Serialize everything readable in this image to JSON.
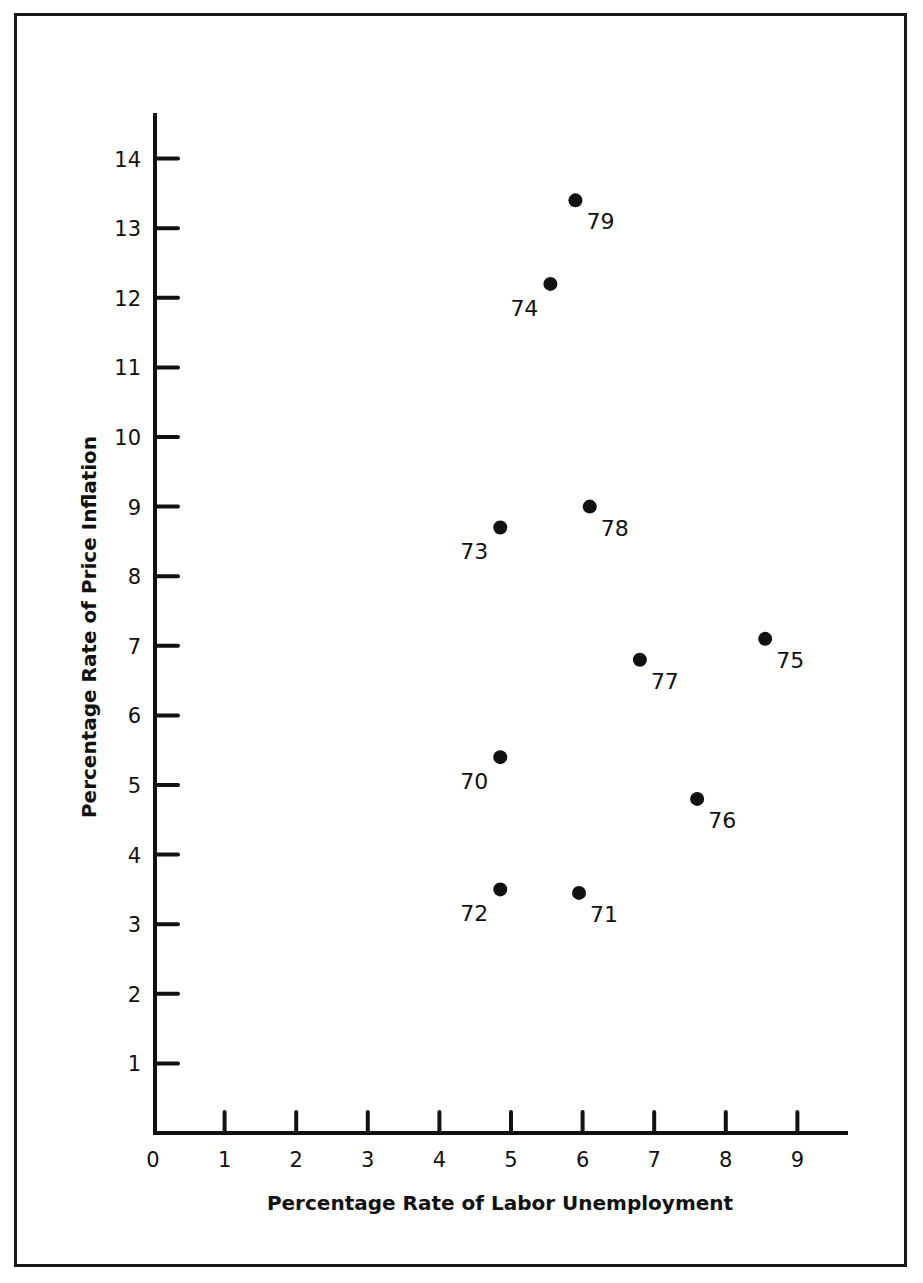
{
  "chart_data": {
    "type": "scatter",
    "title": "",
    "xlabel": "Percentage Rate of Labor Unemployment",
    "ylabel": "Percentage Rate of Price Inflation",
    "xlim": [
      0,
      9.8
    ],
    "ylim": [
      0,
      14.6
    ],
    "x_ticks": [
      "0",
      "1",
      "2",
      "3",
      "4",
      "5",
      "6",
      "7",
      "8",
      "9"
    ],
    "y_ticks": [
      "1",
      "2",
      "3",
      "4",
      "5",
      "6",
      "7",
      "8",
      "9",
      "10",
      "11",
      "12",
      "13",
      "14"
    ],
    "grid": false,
    "legend": "none",
    "points": [
      {
        "label": "70",
        "x": 4.85,
        "y": 5.4,
        "label_pos": "bottom-left"
      },
      {
        "label": "71",
        "x": 5.95,
        "y": 3.45,
        "label_pos": "bottom-right"
      },
      {
        "label": "72",
        "x": 4.85,
        "y": 3.5,
        "label_pos": "bottom-left"
      },
      {
        "label": "73",
        "x": 4.85,
        "y": 8.7,
        "label_pos": "bottom-left"
      },
      {
        "label": "74",
        "x": 5.55,
        "y": 12.2,
        "label_pos": "bottom-left"
      },
      {
        "label": "75",
        "x": 8.55,
        "y": 7.1,
        "label_pos": "bottom-right"
      },
      {
        "label": "76",
        "x": 7.6,
        "y": 4.8,
        "label_pos": "bottom-right"
      },
      {
        "label": "77",
        "x": 6.8,
        "y": 6.8,
        "label_pos": "bottom-right"
      },
      {
        "label": "78",
        "x": 6.1,
        "y": 9.0,
        "label_pos": "bottom-right"
      },
      {
        "label": "79",
        "x": 5.9,
        "y": 13.4,
        "label_pos": "bottom-right"
      }
    ]
  },
  "colors": {
    "ink": "#111111",
    "background": "#ffffff"
  }
}
